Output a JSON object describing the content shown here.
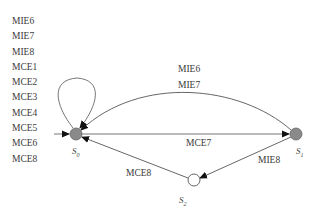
{
  "diagram": {
    "type": "state-transition",
    "self_loop_labels": [
      "MIE6",
      "MIE7",
      "MIE8",
      "MCE1",
      "MCE2",
      "MCE3",
      "MCE4",
      "MCE5",
      "MCE6",
      "MCE8"
    ],
    "states": [
      {
        "id": "S0",
        "label": "S",
        "sub": "0",
        "fill": "#8a8a8a",
        "initial": true
      },
      {
        "id": "S1",
        "label": "S",
        "sub": "1",
        "fill": "#8a8a8a"
      },
      {
        "id": "S2",
        "label": "S",
        "sub": "2",
        "fill": "#ffffff"
      }
    ],
    "edges": [
      {
        "from": "S1",
        "to": "S0",
        "labels": [
          "MIE6",
          "MIE7"
        ],
        "shape": "arc"
      },
      {
        "from": "S0",
        "to": "S1",
        "labels": [
          "MCE7"
        ],
        "shape": "straight"
      },
      {
        "from": "S1",
        "to": "S2",
        "labels": [
          "MIE8"
        ],
        "shape": "straight"
      },
      {
        "from": "S2",
        "to": "S0",
        "labels": [
          "MCE8"
        ],
        "shape": "straight"
      },
      {
        "from": "S0",
        "to": "S0",
        "labels": [
          "MIE6",
          "MIE7",
          "MIE8",
          "MCE1",
          "MCE2",
          "MCE3",
          "MCE4",
          "MCE5",
          "MCE6",
          "MCE8"
        ],
        "shape": "self-loop"
      }
    ],
    "arc_label_1": "MIE6",
    "arc_label_2": "MIE7",
    "mce7_label": "MCE7",
    "mie8_label": "MIE8",
    "mce8_label": "MCE8",
    "colors": {
      "edge": "#555555",
      "visited_node": "#8a8a8a",
      "unvisited_node": "#ffffff"
    }
  }
}
